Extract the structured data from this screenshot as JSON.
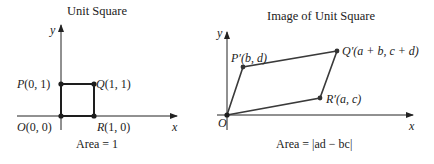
{
  "left_panel": {
    "title": "Unit Square",
    "axis_x_label": "x",
    "axis_y_label": "y",
    "points": {
      "O": {
        "name": "O",
        "coords": "(0, 0)"
      },
      "P": {
        "name": "P",
        "coords": "(0, 1)"
      },
      "Q": {
        "name": "Q",
        "coords": "(1, 1)"
      },
      "R": {
        "name": "R",
        "coords": "(1, 0)"
      }
    },
    "caption": "Area = 1"
  },
  "right_panel": {
    "title": "Image of Unit Square",
    "axis_x_label": "x",
    "axis_y_label": "y",
    "points": {
      "O": {
        "name": "O"
      },
      "P": {
        "name": "P′",
        "coords": "(b, d)"
      },
      "Q": {
        "name": "Q′",
        "coords": "(a + b, c + d)"
      },
      "R": {
        "name": "R′",
        "coords": "(a, c)"
      }
    },
    "caption": "Area = |ad − bc|"
  },
  "colors": {
    "line": "#2a2a2a",
    "point": "#1e1e1e",
    "right_shape": "#444444"
  }
}
